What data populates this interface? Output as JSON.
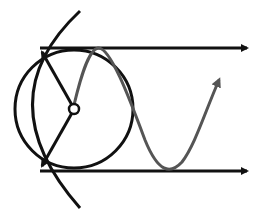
{
  "diagram": {
    "type": "circle-to-sine projection",
    "colors": {
      "stroke": "#111111",
      "sine": "#555555",
      "background": "#ffffff"
    },
    "circle": {
      "cx": 74,
      "cy": 109,
      "r": 60
    },
    "center_dot": {
      "cx": 74,
      "cy": 109,
      "r": 5
    },
    "top_arrow": {
      "y": 48,
      "x1": 40,
      "x2": 247
    },
    "bottom_arrow": {
      "y": 171,
      "x1": 40,
      "x2": 247
    },
    "labels": []
  }
}
